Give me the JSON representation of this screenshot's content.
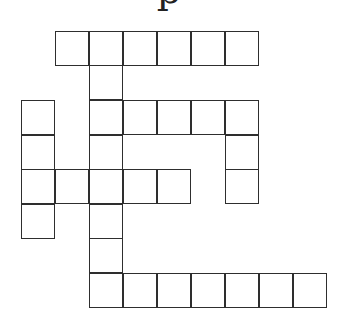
{
  "puzzle": {
    "title_partial": "p",
    "cell_size": 34,
    "line_color": "#2e2e2e",
    "background": "#ffffff",
    "col_x": [
      22,
      56,
      90,
      124,
      158,
      192,
      226,
      260,
      294
    ],
    "row_y": [
      32,
      66,
      101,
      136,
      170,
      205,
      239,
      274
    ],
    "cells": [
      {
        "row": 0,
        "col": 1,
        "letter": ""
      },
      {
        "row": 0,
        "col": 2,
        "letter": ""
      },
      {
        "row": 0,
        "col": 3,
        "letter": ""
      },
      {
        "row": 0,
        "col": 4,
        "letter": ""
      },
      {
        "row": 0,
        "col": 5,
        "letter": ""
      },
      {
        "row": 0,
        "col": 6,
        "letter": ""
      },
      {
        "row": 1,
        "col": 2,
        "letter": ""
      },
      {
        "row": 2,
        "col": 0,
        "letter": ""
      },
      {
        "row": 2,
        "col": 2,
        "letter": ""
      },
      {
        "row": 2,
        "col": 3,
        "letter": ""
      },
      {
        "row": 2,
        "col": 4,
        "letter": ""
      },
      {
        "row": 2,
        "col": 5,
        "letter": ""
      },
      {
        "row": 2,
        "col": 6,
        "letter": ""
      },
      {
        "row": 3,
        "col": 0,
        "letter": ""
      },
      {
        "row": 3,
        "col": 2,
        "letter": ""
      },
      {
        "row": 3,
        "col": 6,
        "letter": ""
      },
      {
        "row": 4,
        "col": 0,
        "letter": ""
      },
      {
        "row": 4,
        "col": 1,
        "letter": ""
      },
      {
        "row": 4,
        "col": 2,
        "letter": ""
      },
      {
        "row": 4,
        "col": 3,
        "letter": ""
      },
      {
        "row": 4,
        "col": 4,
        "letter": ""
      },
      {
        "row": 4,
        "col": 6,
        "letter": ""
      },
      {
        "row": 5,
        "col": 0,
        "letter": ""
      },
      {
        "row": 5,
        "col": 2,
        "letter": ""
      },
      {
        "row": 6,
        "col": 2,
        "letter": ""
      },
      {
        "row": 7,
        "col": 2,
        "letter": ""
      },
      {
        "row": 7,
        "col": 3,
        "letter": ""
      },
      {
        "row": 7,
        "col": 4,
        "letter": ""
      },
      {
        "row": 7,
        "col": 5,
        "letter": ""
      },
      {
        "row": 7,
        "col": 6,
        "letter": ""
      },
      {
        "row": 7,
        "col": 7,
        "letter": ""
      },
      {
        "row": 7,
        "col": 8,
        "letter": ""
      }
    ]
  }
}
